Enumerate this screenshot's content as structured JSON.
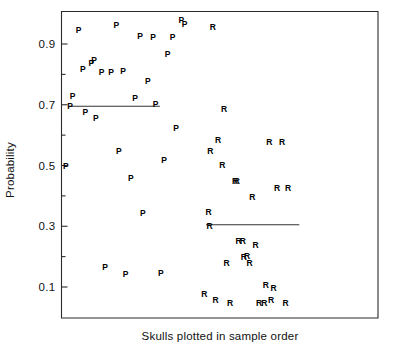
{
  "chart_data": {
    "type": "scatter",
    "title": "",
    "xlabel": "Skulls plotted in sample order",
    "ylabel": "Probability",
    "xlim": [
      0,
      74
    ],
    "ylim": [
      0.0,
      1.0
    ],
    "grid": false,
    "legend_position": "none",
    "y_ticks_major": [
      0.1,
      0.3,
      0.5,
      0.7,
      0.9
    ],
    "y_tick_labels": [
      "0.1",
      "0.3",
      "0.5",
      "0.7",
      "0.9"
    ],
    "y_ticks_minor": [
      0.2,
      0.4,
      0.6,
      0.8
    ],
    "x_ticks": [],
    "x_tick_labels": [],
    "series": [
      {
        "name": "P",
        "marker": "P",
        "color": "#000000",
        "points": [
          {
            "x": 1,
            "y": 0.495
          },
          {
            "x": 2,
            "y": 0.695
          },
          {
            "x": 2.6,
            "y": 0.725
          },
          {
            "x": 4,
            "y": 0.945
          },
          {
            "x": 5,
            "y": 0.815
          },
          {
            "x": 5.6,
            "y": 0.675
          },
          {
            "x": 7,
            "y": 0.835
          },
          {
            "x": 7.6,
            "y": 0.845
          },
          {
            "x": 8,
            "y": 0.655
          },
          {
            "x": 9.4,
            "y": 0.805
          },
          {
            "x": 10.2,
            "y": 0.165
          },
          {
            "x": 11.6,
            "y": 0.805
          },
          {
            "x": 12.8,
            "y": 0.96
          },
          {
            "x": 13.4,
            "y": 0.545
          },
          {
            "x": 14.4,
            "y": 0.81
          },
          {
            "x": 15,
            "y": 0.14
          },
          {
            "x": 16.2,
            "y": 0.455
          },
          {
            "x": 17.2,
            "y": 0.72
          },
          {
            "x": 18.4,
            "y": 0.925
          },
          {
            "x": 19,
            "y": 0.34
          },
          {
            "x": 20.2,
            "y": 0.775
          },
          {
            "x": 21.4,
            "y": 0.92
          },
          {
            "x": 22,
            "y": 0.7
          },
          {
            "x": 23.2,
            "y": 0.145
          },
          {
            "x": 24,
            "y": 0.515
          },
          {
            "x": 24.8,
            "y": 0.865
          },
          {
            "x": 26,
            "y": 0.92
          },
          {
            "x": 26.8,
            "y": 0.62
          },
          {
            "x": 28,
            "y": 0.975
          },
          {
            "x": 28.8,
            "y": 0.965
          }
        ]
      },
      {
        "name": "R",
        "marker": "R",
        "color": "#000000",
        "points": [
          {
            "x": 35.4,
            "y": 0.955
          },
          {
            "x": 33.4,
            "y": 0.075
          },
          {
            "x": 34.4,
            "y": 0.345
          },
          {
            "x": 34.6,
            "y": 0.3
          },
          {
            "x": 34.8,
            "y": 0.545
          },
          {
            "x": 36,
            "y": 0.055
          },
          {
            "x": 36.6,
            "y": 0.58
          },
          {
            "x": 37.6,
            "y": 0.5
          },
          {
            "x": 38,
            "y": 0.685
          },
          {
            "x": 38.6,
            "y": 0.175
          },
          {
            "x": 39.4,
            "y": 0.045
          },
          {
            "x": 40.6,
            "y": 0.445
          },
          {
            "x": 41,
            "y": 0.445
          },
          {
            "x": 41.4,
            "y": 0.25
          },
          {
            "x": 42.4,
            "y": 0.25
          },
          {
            "x": 42.6,
            "y": 0.195
          },
          {
            "x": 43.4,
            "y": 0.2
          },
          {
            "x": 44,
            "y": 0.175
          },
          {
            "x": 44.6,
            "y": 0.395
          },
          {
            "x": 45.4,
            "y": 0.235
          },
          {
            "x": 46.2,
            "y": 0.045
          },
          {
            "x": 47.4,
            "y": 0.045
          },
          {
            "x": 47.8,
            "y": 0.105
          },
          {
            "x": 48.6,
            "y": 0.575
          },
          {
            "x": 49,
            "y": 0.055
          },
          {
            "x": 49.6,
            "y": 0.095
          },
          {
            "x": 50.4,
            "y": 0.425
          },
          {
            "x": 51.6,
            "y": 0.575
          },
          {
            "x": 52.4,
            "y": 0.045
          },
          {
            "x": 53,
            "y": 0.425
          }
        ]
      }
    ],
    "reference_lines": [
      {
        "name": "P-group-mean",
        "y": 0.695,
        "x_start": 1.8,
        "x_end": 23.0
      },
      {
        "name": "R-group-mean",
        "y": 0.305,
        "x_start": 33.8,
        "x_end": 55.6
      }
    ]
  }
}
